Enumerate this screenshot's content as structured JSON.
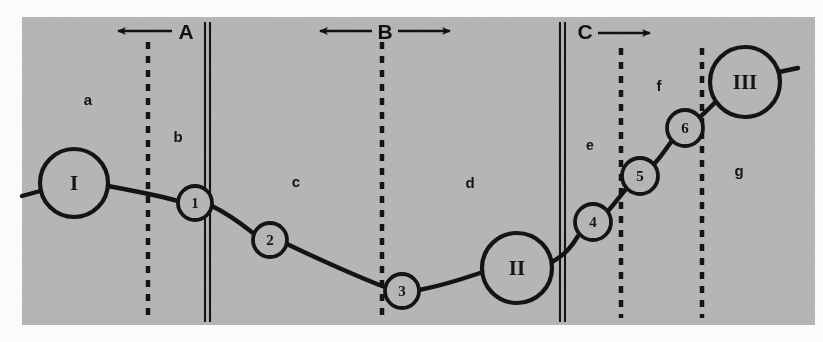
{
  "figure": {
    "background_color": "#b9b9b9",
    "panel": {
      "x": 22,
      "y": 17,
      "width": 793,
      "height": 308
    },
    "ink_color": "#141414",
    "page_color": "#ffffff"
  },
  "markers": [
    {
      "id": "marker-a",
      "label": "A",
      "x": 186,
      "y": 31,
      "arrows": "left",
      "boundary_x": 148
    },
    {
      "id": "marker-b",
      "label": "B",
      "x": 385,
      "y": 31,
      "arrows": "both",
      "boundary_x": 382
    },
    {
      "id": "marker-c",
      "label": "C",
      "x": 585,
      "y": 31,
      "arrows": "right",
      "boundary_x": 621
    }
  ],
  "boundaries": {
    "dashed": [
      {
        "name": "dashed-line-1",
        "x": 148,
        "y1": 42,
        "y2": 318
      },
      {
        "name": "dashed-line-2",
        "x": 382,
        "y1": 42,
        "y2": 318
      },
      {
        "name": "dashed-line-3",
        "x": 621,
        "y1": 48,
        "y2": 318
      },
      {
        "name": "dashed-line-4",
        "x": 702,
        "y1": 48,
        "y2": 318
      }
    ],
    "solid_double": [
      {
        "name": "double-line-1",
        "x": 207,
        "y1": 22,
        "y2": 322
      },
      {
        "name": "double-line-2",
        "x": 562,
        "y1": 22,
        "y2": 322
      }
    ]
  },
  "regions": [
    {
      "label": "a",
      "x": 88,
      "y": 99
    },
    {
      "label": "b",
      "x": 178,
      "y": 136
    },
    {
      "label": "c",
      "x": 296,
      "y": 181
    },
    {
      "label": "d",
      "x": 470,
      "y": 182
    },
    {
      "label": "e",
      "x": 590,
      "y": 145
    },
    {
      "label": "f",
      "x": 659,
      "y": 85
    },
    {
      "label": "g",
      "x": 739,
      "y": 170
    }
  ],
  "nodes": [
    {
      "label": "I",
      "x": 74,
      "y": 183,
      "r": 34,
      "size": "large",
      "font_size": 21
    },
    {
      "label": "1",
      "x": 195,
      "y": 203,
      "r": 17,
      "size": "small",
      "font_size": 15
    },
    {
      "label": "2",
      "x": 270,
      "y": 240,
      "r": 17,
      "size": "small",
      "font_size": 15
    },
    {
      "label": "3",
      "x": 402,
      "y": 291,
      "r": 17,
      "size": "small",
      "font_size": 15
    },
    {
      "label": "II",
      "x": 517,
      "y": 268,
      "r": 35,
      "size": "large",
      "font_size": 21
    },
    {
      "label": "4",
      "x": 593,
      "y": 222,
      "r": 18,
      "size": "small",
      "font_size": 15
    },
    {
      "label": "5",
      "x": 640,
      "y": 176,
      "r": 18,
      "size": "small",
      "font_size": 15
    },
    {
      "label": "6",
      "x": 685,
      "y": 128,
      "r": 18,
      "size": "small",
      "font_size": 15
    },
    {
      "label": "III",
      "x": 745,
      "y": 82,
      "r": 35,
      "size": "large",
      "font_size": 21
    }
  ],
  "chain_path": "M 22,196 L 44,190 M 108,186 C 140,192 168,198 178,201 M 212,206 C 232,216 244,226 253,233 M 287,244 C 320,260 368,281 385,287 M 419,290 C 450,284 470,276 483,272 M 552,262 C 566,254 572,246 578,236 M 608,211 C 616,202 620,196 626,189 M 655,163 C 664,153 666,148 672,141 M 700,117 C 708,110 712,105 718,100 M 779,72 L 798,68",
  "chain_segments": [
    {
      "from": "edge-left",
      "to": "I"
    },
    {
      "from": "I",
      "to": "1"
    },
    {
      "from": "1",
      "to": "2"
    },
    {
      "from": "2",
      "to": "3"
    },
    {
      "from": "3",
      "to": "II"
    },
    {
      "from": "II",
      "to": "4"
    },
    {
      "from": "4",
      "to": "5"
    },
    {
      "from": "5",
      "to": "6"
    },
    {
      "from": "6",
      "to": "III"
    },
    {
      "from": "III",
      "to": "edge-right"
    }
  ]
}
